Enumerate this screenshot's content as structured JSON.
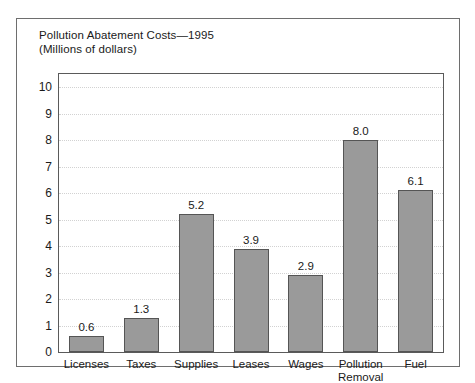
{
  "figure": {
    "title_lines": [
      "Pollution Abatement Costs—1995",
      "(Millions of dollars)"
    ]
  },
  "chart_data": {
    "type": "bar",
    "title": "Pollution Abatement Costs—1995 (Millions of dollars)",
    "subtitle": "(Millions of dollars)",
    "xlabel": "",
    "ylabel": "",
    "ylim": [
      0,
      10
    ],
    "ytick_step": 1,
    "grid": true,
    "legend": "none",
    "bar_color": "#9a9a9a",
    "bar_edge_color": "#555555",
    "categories": [
      "Licenses",
      "Taxes",
      "Supplies",
      "Leases",
      "Wages",
      "Pollution Removal",
      "Fuel"
    ],
    "category_label_lines": [
      [
        "Licenses"
      ],
      [
        "Taxes"
      ],
      [
        "Supplies"
      ],
      [
        "Leases"
      ],
      [
        "Wages"
      ],
      [
        "Pollution",
        "Removal"
      ],
      [
        "Fuel"
      ]
    ],
    "values": [
      0.6,
      1.3,
      5.2,
      3.9,
      2.9,
      8.0,
      6.1
    ],
    "value_labels": [
      "0.6",
      "1.3",
      "5.2",
      "3.9",
      "2.9",
      "8.0",
      "6.1"
    ],
    "yticks": [
      0,
      1,
      2,
      3,
      4,
      5,
      6,
      7,
      8,
      9,
      10
    ],
    "ytick_labels": [
      "0",
      "1",
      "2",
      "3",
      "4",
      "5",
      "6",
      "7",
      "8",
      "9",
      "10"
    ]
  }
}
